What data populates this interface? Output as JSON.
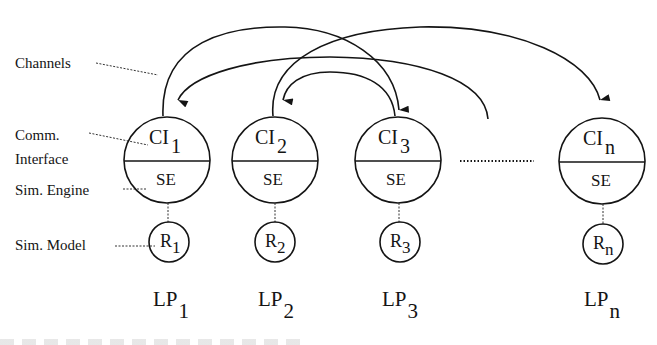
{
  "diagram": {
    "labels": {
      "channels": "Channels",
      "comm": "Comm.",
      "interface": "Interface",
      "sim_engine": "Sim. Engine",
      "sim_model": "Sim. Model"
    },
    "nodes": [
      {
        "id": "LP1",
        "ci": "CI",
        "ci_sub": "1",
        "se": "SE",
        "r": "R",
        "r_sub": "1",
        "lp": "LP",
        "lp_sub": "1"
      },
      {
        "id": "LP2",
        "ci": "CI",
        "ci_sub": "2",
        "se": "SE",
        "r": "R",
        "r_sub": "2",
        "lp": "LP",
        "lp_sub": "2"
      },
      {
        "id": "LP3",
        "ci": "CI",
        "ci_sub": "3",
        "se": "SE",
        "r": "R",
        "r_sub": "3",
        "lp": "LP",
        "lp_sub": "3"
      },
      {
        "id": "LPn",
        "ci": "CI",
        "ci_sub": "n",
        "se": "SE",
        "r": "R",
        "r_sub": "n",
        "lp": "LP",
        "lp_sub": "n"
      }
    ],
    "edges": [
      {
        "from": "LP1",
        "to": "LP3",
        "kind": "channel"
      },
      {
        "from": "beyond-LP3",
        "to": "LP1",
        "kind": "channel"
      },
      {
        "from": "LP2",
        "to": "LPn",
        "kind": "channel"
      },
      {
        "from": "LP3",
        "to": "LP2",
        "kind": "channel"
      }
    ],
    "ellipsis": "…",
    "colors": {
      "ink": "#141414",
      "background": "#ffffff"
    }
  }
}
